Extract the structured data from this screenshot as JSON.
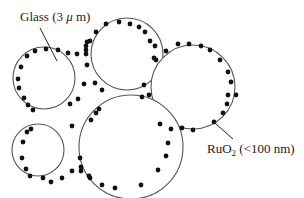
{
  "diagram": {
    "colors": {
      "background": "#ffffff",
      "circle_stroke": "#555555",
      "particle_fill": "#111111",
      "text": "#222222"
    },
    "labels": {
      "glass": {
        "text_main": "Glass (3 ",
        "text_mu": "μ",
        "text_unit": " m)",
        "full": "Glass (3 μ m)"
      },
      "ruo2": {
        "text_main": "RuO",
        "text_sub": "2",
        "text_tail": " (<100 nm)",
        "full": "RuO2 (<100 nm)"
      }
    },
    "glass_particles": [
      {
        "id": "top-left",
        "cx": 44,
        "cy": 78,
        "r": 31
      },
      {
        "id": "top-middle",
        "cx": 127,
        "cy": 54,
        "r": 36
      },
      {
        "id": "right",
        "cx": 193,
        "cy": 87,
        "r": 42
      },
      {
        "id": "bottom-left",
        "cx": 38,
        "cy": 150,
        "r": 26
      },
      {
        "id": "bottom-middle",
        "cx": 131,
        "cy": 147,
        "r": 52
      }
    ]
  }
}
